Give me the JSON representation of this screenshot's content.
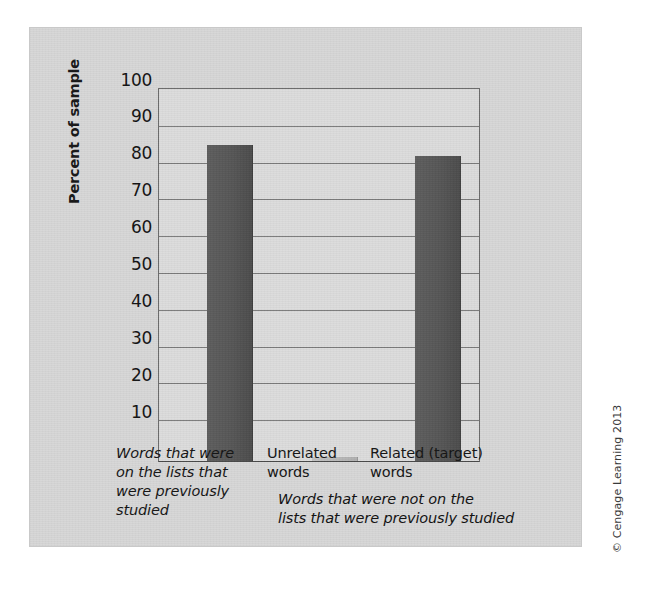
{
  "figure": {
    "credit": "© Cengage Learning 2013",
    "panel_bg": "#d7d7d7",
    "plot_bg": "#dcdcdc",
    "bar_color": "#585858",
    "bar_cap_color": "#8e8e8e",
    "gridline_color": "#7b7b7b",
    "axis_color": "#6a6a6a"
  },
  "chart_data": {
    "type": "bar",
    "title": "",
    "subtitle": "",
    "xlabel": "",
    "ylabel": "Percent of sample",
    "ylim": [
      0,
      100
    ],
    "yticks": [
      10,
      20,
      30,
      40,
      50,
      60,
      70,
      80,
      90,
      100
    ],
    "ytick_labels": [
      "10",
      "20",
      "30",
      "40",
      "50",
      "60",
      "70",
      "80",
      "90",
      "100"
    ],
    "grid": true,
    "legend": "none",
    "categories": [
      "Words that were on the lists that were previously studied",
      "Unrelated words",
      "Related (target) words"
    ],
    "category_label_lines": [
      [
        "Words that were",
        "on the lists that",
        "were previously",
        "studied"
      ],
      [
        "Unrelated",
        "words"
      ],
      [
        "Related (target)",
        "words"
      ]
    ],
    "values": [
      85,
      1,
      82
    ],
    "annotations": [
      {
        "text": "Words that were not on the lists that were previously studied",
        "lines": [
          "Words that were not on the",
          "lists that were previously studied"
        ],
        "applies_to": [
          "Unrelated words",
          "Related (target) words"
        ]
      }
    ]
  }
}
